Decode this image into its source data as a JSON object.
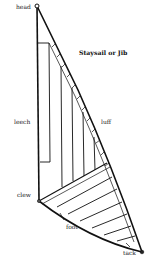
{
  "diagram": {
    "title": "Staysail or Jib",
    "labels": {
      "head": "head",
      "leech": "leech",
      "luff": "luff",
      "clew": "clew",
      "foot": "foot",
      "tack": "tack"
    },
    "colors": {
      "line": "#111111",
      "background": "#ffffff"
    }
  }
}
